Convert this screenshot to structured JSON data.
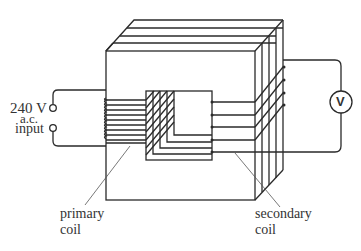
{
  "diagram": {
    "type": "transformer",
    "labels": {
      "input_voltage": "240 V",
      "input_type": "a.c.",
      "input_word": "input",
      "primary_line1": "primary",
      "primary_line2": "coil",
      "secondary_line1": "secondary",
      "secondary_line2": "coil",
      "voltmeter": "V"
    },
    "components": [
      "laminated iron core",
      "primary coil",
      "secondary coil",
      "voltmeter",
      "a.c. input terminals"
    ],
    "colors": {
      "line": "#2a2a2a",
      "text": "#333333",
      "background": "#ffffff"
    }
  }
}
